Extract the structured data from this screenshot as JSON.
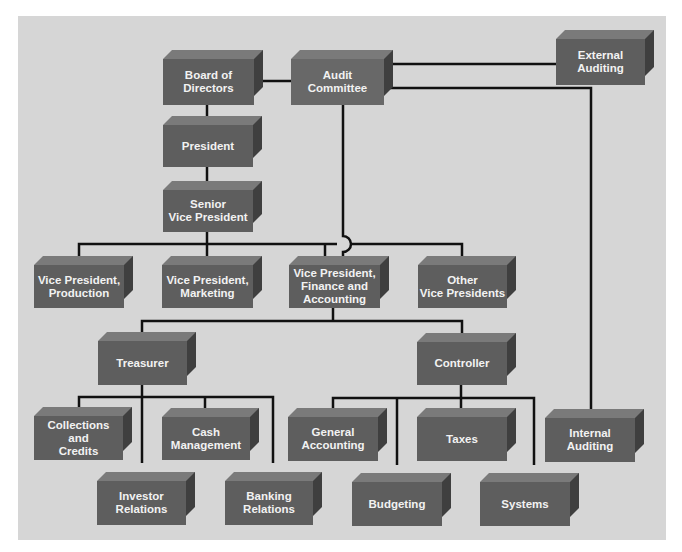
{
  "colors": {
    "panel": "#d6d6d6",
    "box_front": "#5e5e5e",
    "box_top": "#7a7a7a",
    "box_side": "#3f3f3f",
    "box_text": "#f2f2f2",
    "connector": "#111111"
  },
  "nodes": {
    "board": {
      "label": "Board of\nDirectors"
    },
    "audit_committee": {
      "label": "Audit\nCommittee"
    },
    "external_auditing": {
      "label": "External\nAuditing"
    },
    "president": {
      "label": "President"
    },
    "senior_vp": {
      "label": "Senior\nVice President"
    },
    "vp_production": {
      "label": "Vice President,\nProduction"
    },
    "vp_marketing": {
      "label": "Vice President,\nMarketing"
    },
    "vp_finance": {
      "label": "Vice President,\nFinance and\nAccounting"
    },
    "other_vps": {
      "label": "Other\nVice Presidents"
    },
    "treasurer": {
      "label": "Treasurer"
    },
    "controller": {
      "label": "Controller"
    },
    "collections": {
      "label": "Collections\nand\nCredits"
    },
    "cash_management": {
      "label": "Cash\nManagement"
    },
    "investor_relations": {
      "label": "Investor\nRelations"
    },
    "banking_relations": {
      "label": "Banking\nRelations"
    },
    "general_accounting": {
      "label": "General\nAccounting"
    },
    "taxes": {
      "label": "Taxes"
    },
    "budgeting": {
      "label": "Budgeting"
    },
    "systems": {
      "label": "Systems"
    },
    "internal_auditing": {
      "label": "Internal\nAuditing"
    }
  },
  "edges": [
    [
      "board",
      "audit_committee"
    ],
    [
      "audit_committee",
      "external_auditing"
    ],
    [
      "audit_committee",
      "internal_auditing"
    ],
    [
      "audit_committee",
      "vp_finance"
    ],
    [
      "board",
      "president"
    ],
    [
      "president",
      "senior_vp"
    ],
    [
      "senior_vp",
      "vp_production"
    ],
    [
      "senior_vp",
      "vp_marketing"
    ],
    [
      "senior_vp",
      "vp_finance"
    ],
    [
      "senior_vp",
      "other_vps"
    ],
    [
      "vp_finance",
      "treasurer"
    ],
    [
      "vp_finance",
      "controller"
    ],
    [
      "treasurer",
      "collections"
    ],
    [
      "treasurer",
      "cash_management"
    ],
    [
      "treasurer",
      "investor_relations"
    ],
    [
      "treasurer",
      "banking_relations"
    ],
    [
      "controller",
      "general_accounting"
    ],
    [
      "controller",
      "taxes"
    ],
    [
      "controller",
      "budgeting"
    ],
    [
      "controller",
      "systems"
    ]
  ]
}
